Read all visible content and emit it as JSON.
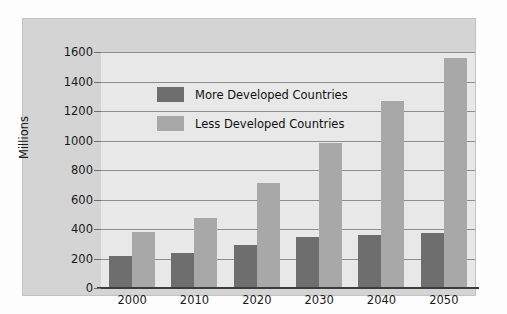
{
  "chart_data": {
    "type": "bar",
    "title": "",
    "xlabel": "",
    "ylabel": "Millions",
    "categories": [
      "2000",
      "2010",
      "2020",
      "2030",
      "2040",
      "2050"
    ],
    "series": [
      {
        "name": "More Developed Countries",
        "color": "#6e6e6e",
        "values": [
          220,
          235,
          290,
          345,
          360,
          375
        ]
      },
      {
        "name": "Less Developed Countries",
        "color": "#a8a8a8",
        "values": [
          380,
          475,
          710,
          985,
          1270,
          1560
        ]
      }
    ],
    "ylim": [
      0,
      1600
    ],
    "ytick_values": [
      0,
      200,
      400,
      600,
      800,
      1000,
      1200,
      1400,
      1600
    ],
    "ytick_labels": [
      "0",
      "200",
      "400",
      "600",
      "800",
      "1000",
      "1200",
      "1400",
      "1600"
    ],
    "grid": true,
    "legend_position": "upper-center-left",
    "colors": {
      "panel": "#d4d4d4",
      "plot_background": "#e8e8e8",
      "gridline": "#8e8e8e",
      "axis": "#3c3c3c",
      "text": "#1a1a1a"
    }
  }
}
